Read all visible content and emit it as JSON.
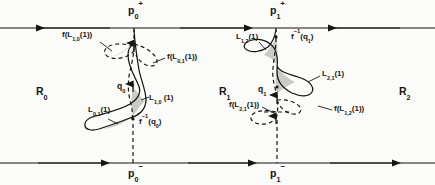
{
  "figure": {
    "background_color": "#fbfbf9",
    "ink_color": "#151515",
    "shade_color": "#b9b9b5",
    "width": 435,
    "height": 185
  },
  "regions": [
    {
      "name": "region-0",
      "label": "R",
      "sub": "0",
      "x": 36,
      "y": 86
    },
    {
      "name": "region-1",
      "label": "R",
      "sub": "1",
      "x": 219,
      "y": 86
    },
    {
      "name": "region-2",
      "label": "R",
      "sub": "2",
      "x": 399,
      "y": 86
    }
  ],
  "boundary_points": [
    {
      "name": "p0-plus",
      "label": "p",
      "sub": "0",
      "sup": "+",
      "x": 134,
      "y": 4
    },
    {
      "name": "p0-minus",
      "label": "p",
      "sub": "0",
      "sup": "−",
      "x": 134,
      "y": 166
    },
    {
      "name": "p1-plus",
      "label": "p",
      "sub": "1",
      "sup": "+",
      "x": 276,
      "y": 4
    },
    {
      "name": "p1-minus",
      "label": "p",
      "sub": "1",
      "sup": "−",
      "x": 276,
      "y": 166
    }
  ],
  "intersection_points": [
    {
      "name": "q0",
      "label": "q",
      "sub": "0",
      "x": 119,
      "y": 85
    },
    {
      "name": "q1",
      "label": "q",
      "sub": "1",
      "x": 260,
      "y": 85
    }
  ],
  "lobe_labels": [
    {
      "name": "lobe-L01-1",
      "text": "L",
      "sub": "0,1",
      "arg": "(1)",
      "x": 88,
      "y": 110
    },
    {
      "name": "lobe-L10-1",
      "text": "L",
      "sub": "1,0",
      "arg": " (1)",
      "x": 143,
      "y": 99
    },
    {
      "name": "lobe-L12-1",
      "text": "L",
      "sub": "1,2",
      "arg": "(1)",
      "x": 242,
      "y": 33
    },
    {
      "name": "lobe-L21-1",
      "text": "L",
      "sub": "2,1",
      "arg": "(1)",
      "x": 322,
      "y": 72
    }
  ],
  "image_labels": [
    {
      "name": "image-f-L10-1",
      "text": "f(L",
      "sub": "1,0",
      "tail": "(1))",
      "x": 62,
      "y": 31
    },
    {
      "name": "image-f-L01-1",
      "text": "f(L",
      "sub": "0,1",
      "tail": "(1))",
      "x": 167,
      "y": 54
    },
    {
      "name": "image-f-inv-q0",
      "text": "f",
      "sup": "−1",
      "tail": "(q",
      "sub2": "0",
      "close": ")",
      "x": 140,
      "y": 122
    },
    {
      "name": "image-f-inv-q1",
      "text": "f",
      "sup": "−1",
      "tail": "(q",
      "sub2": "1",
      "close": ")",
      "x": 313,
      "y": 33
    },
    {
      "name": "image-f-L21-1",
      "text": "f(L",
      "sub": "2,1",
      "tail": "(1))",
      "x": 233,
      "y": 104
    },
    {
      "name": "image-f-L12-1",
      "text": "f(L",
      "sub": "1,2",
      "tail": "(1))",
      "x": 334,
      "y": 108
    }
  ],
  "manifold_lines": [
    {
      "name": "upper-manifold",
      "y": 28,
      "direction_segments": "left,right,left"
    },
    {
      "name": "lower-manifold",
      "y": 163,
      "direction_segments": "right,right,right"
    }
  ],
  "legend_note": ""
}
